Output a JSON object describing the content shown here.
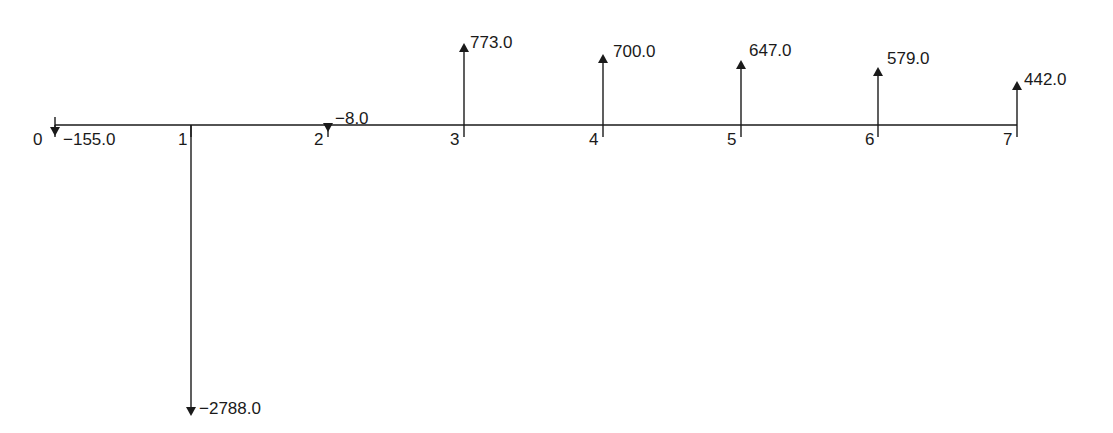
{
  "diagram": {
    "type": "cash-flow-diagram",
    "periods": [
      {
        "period": "0",
        "amount": "−155.0",
        "value": -155.0
      },
      {
        "period": "1",
        "amount": "−2788.0",
        "value": -2788.0
      },
      {
        "period": "2",
        "amount": "−8.0",
        "value": -8.0
      },
      {
        "period": "3",
        "amount": "773.0",
        "value": 773.0
      },
      {
        "period": "4",
        "amount": "700.0",
        "value": 700.0
      },
      {
        "period": "5",
        "amount": "647.0",
        "value": 647.0
      },
      {
        "period": "6",
        "amount": "579.0",
        "value": 579.0
      },
      {
        "period": "7",
        "amount": "442.0",
        "value": 442.0
      }
    ]
  },
  "chart_data": {
    "type": "bar",
    "title": "",
    "xlabel": "Period",
    "ylabel": "Cash flow",
    "categories": [
      "0",
      "1",
      "2",
      "3",
      "4",
      "5",
      "6",
      "7"
    ],
    "values": [
      -155.0,
      -2788.0,
      -8.0,
      773.0,
      700.0,
      647.0,
      579.0,
      442.0
    ],
    "grid": false
  },
  "layout": {
    "axis_y": 125,
    "axis_x0": 55,
    "axis_x1": 1017,
    "ticks_x": [
      55,
      191,
      328,
      464,
      603,
      741,
      878,
      1017
    ],
    "arrow_tip_y": [
      136,
      416,
      132,
      43,
      54,
      60,
      67,
      81
    ],
    "color": "#1a1a1a"
  }
}
